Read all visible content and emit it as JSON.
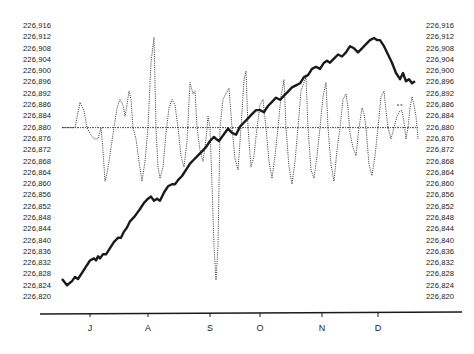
{
  "chart_data": {
    "type": "line",
    "title": "",
    "xlabel": "",
    "ylabel": "",
    "ylim": [
      226820,
      226916
    ],
    "y_ticks": [
      "226,916",
      "226,912",
      "226,908",
      "226,904",
      "226,900",
      "226,896",
      "226,892",
      "226,886",
      "226,884",
      "226,880",
      "226,876",
      "226,872",
      "226,868",
      "226,864",
      "226,860",
      "226,856",
      "226,852",
      "226,848",
      "226,844",
      "226,840",
      "226,836",
      "226,832",
      "226,828",
      "226,824",
      "226,820"
    ],
    "x_ticks": [
      {
        "label": "J",
        "x": 90
      },
      {
        "label": "A",
        "x": 148
      },
      {
        "label": "S",
        "x": 210
      },
      {
        "label": "O",
        "x": 260
      },
      {
        "label": "N",
        "x": 322
      },
      {
        "label": "D",
        "x": 378
      }
    ],
    "reference_line": {
      "value": 226880,
      "style": "dash-dot"
    },
    "series": [
      {
        "name": "trend (solid)",
        "style": "solid",
        "color": "#1a1a1a",
        "points": [
          [
            62,
            226826
          ],
          [
            67,
            226823
          ],
          [
            72,
            226825
          ],
          [
            75,
            226827
          ],
          [
            78,
            226826
          ],
          [
            82,
            226829
          ],
          [
            86,
            226832
          ],
          [
            90,
            226835
          ],
          [
            94,
            226836
          ],
          [
            96,
            226835
          ],
          [
            98,
            226837
          ],
          [
            100,
            226836
          ],
          [
            103,
            226838
          ],
          [
            106,
            226838
          ],
          [
            110,
            226841
          ],
          [
            114,
            226844
          ],
          [
            118,
            226846
          ],
          [
            121,
            226846
          ],
          [
            124,
            226849
          ],
          [
            127,
            226851
          ],
          [
            130,
            226854
          ],
          [
            134,
            226856
          ],
          [
            137,
            226858
          ],
          [
            140,
            226860
          ],
          [
            144,
            226863
          ],
          [
            148,
            226865
          ],
          [
            151,
            226866
          ],
          [
            154,
            226864
          ],
          [
            157,
            226865
          ],
          [
            160,
            226864
          ],
          [
            164,
            226868
          ],
          [
            168,
            226871
          ],
          [
            172,
            226872
          ],
          [
            175,
            226872
          ],
          [
            178,
            226874
          ],
          [
            182,
            226876
          ],
          [
            186,
            226879
          ],
          [
            190,
            226882
          ],
          [
            194,
            226884
          ],
          [
            198,
            226886
          ],
          [
            202,
            226888
          ],
          [
            206,
            226890
          ],
          [
            210,
            226893
          ],
          [
            214,
            226895
          ],
          [
            216,
            226894
          ],
          [
            219,
            226893
          ],
          [
            222,
            226895
          ],
          [
            225,
            226897
          ],
          [
            228,
            226899
          ],
          [
            232,
            226897
          ],
          [
            236,
            226896
          ],
          [
            240,
            226900
          ],
          [
            244,
            226902
          ],
          [
            248,
            226904
          ],
          [
            252,
            226906
          ],
          [
            256,
            226908
          ],
          [
            260,
            226908
          ],
          [
            264,
            226907
          ],
          [
            268,
            226910
          ],
          [
            272,
            226912
          ],
          [
            276,
            226914
          ],
          [
            280,
            226913
          ],
          [
            284,
            226915
          ],
          [
            288,
            226917
          ],
          [
            292,
            226919
          ],
          [
            296,
            226920
          ],
          [
            300,
            226921
          ],
          [
            304,
            226924
          ],
          [
            308,
            226925
          ],
          [
            312,
            226928
          ],
          [
            316,
            226929
          ],
          [
            320,
            226928
          ],
          [
            324,
            226931
          ],
          [
            327,
            226932
          ],
          [
            330,
            226931
          ],
          [
            334,
            226933
          ],
          [
            338,
            226935
          ],
          [
            342,
            226934
          ],
          [
            346,
            226936
          ],
          [
            350,
            226939
          ],
          [
            354,
            226938
          ],
          [
            358,
            226936
          ],
          [
            362,
            226938
          ],
          [
            366,
            226940
          ],
          [
            370,
            226942
          ],
          [
            374,
            226943
          ],
          [
            377,
            226942
          ],
          [
            380,
            226942
          ],
          [
            384,
            226939
          ],
          [
            388,
            226935
          ],
          [
            392,
            226931
          ],
          [
            396,
            226926
          ],
          [
            400,
            226923
          ],
          [
            403,
            226926
          ],
          [
            406,
            226922
          ],
          [
            409,
            226923
          ],
          [
            412,
            226921
          ],
          [
            415,
            226922
          ]
        ]
      },
      {
        "name": "deviation (dotted)",
        "style": "dotted",
        "color": "#333333",
        "points": [
          [
            62,
            226880
          ],
          [
            75,
            226880
          ],
          [
            80,
            226889
          ],
          [
            84,
            226886
          ],
          [
            87,
            226880
          ],
          [
            90,
            226878
          ],
          [
            94,
            226876
          ],
          [
            98,
            226876
          ],
          [
            101,
            226880
          ],
          [
            103,
            226872
          ],
          [
            105,
            226861
          ],
          [
            107,
            226864
          ],
          [
            109,
            226868
          ],
          [
            111,
            226873
          ],
          [
            114,
            226880
          ],
          [
            117,
            226887
          ],
          [
            120,
            226890
          ],
          [
            123,
            226888
          ],
          [
            125,
            226884
          ],
          [
            127,
            226888
          ],
          [
            129,
            226893
          ],
          [
            131,
            226890
          ],
          [
            133,
            226880
          ],
          [
            136,
            226876
          ],
          [
            139,
            226868
          ],
          [
            142,
            226861
          ],
          [
            145,
            226868
          ],
          [
            148,
            226880
          ],
          [
            151,
            226903
          ],
          [
            154,
            226912
          ],
          [
            156,
            226880
          ],
          [
            158,
            226866
          ],
          [
            160,
            226862
          ],
          [
            163,
            226866
          ],
          [
            166,
            226878
          ],
          [
            169,
            226887
          ],
          [
            172,
            226890
          ],
          [
            175,
            226888
          ],
          [
            178,
            226880
          ],
          [
            181,
            226870
          ],
          [
            184,
            226866
          ],
          [
            187,
            226875
          ],
          [
            190,
            226896
          ],
          [
            193,
            226892
          ],
          [
            195,
            226893
          ],
          [
            197,
            226880
          ],
          [
            200,
            226872
          ],
          [
            203,
            226868
          ],
          [
            206,
            226876
          ],
          [
            208,
            226884
          ],
          [
            210,
            226880
          ],
          [
            212,
            226860
          ],
          [
            214,
            226838
          ],
          [
            216,
            226826
          ],
          [
            218,
            226838
          ],
          [
            220,
            226880
          ],
          [
            223,
            226890
          ],
          [
            226,
            226892
          ],
          [
            229,
            226894
          ],
          [
            232,
            226880
          ],
          [
            235,
            226869
          ],
          [
            238,
            226865
          ],
          [
            241,
            226880
          ],
          [
            244,
            226897
          ],
          [
            246,
            226900
          ],
          [
            248,
            226880
          ],
          [
            251,
            226866
          ],
          [
            254,
            226870
          ],
          [
            257,
            226880
          ],
          [
            260,
            226888
          ],
          [
            263,
            226890
          ],
          [
            266,
            226880
          ],
          [
            269,
            226868
          ],
          [
            272,
            226862
          ],
          [
            275,
            226870
          ],
          [
            278,
            226880
          ],
          [
            281,
            226891
          ],
          [
            284,
            226897
          ],
          [
            286,
            226880
          ],
          [
            289,
            226866
          ],
          [
            292,
            226860
          ],
          [
            295,
            226868
          ],
          [
            298,
            226880
          ],
          [
            301,
            226893
          ],
          [
            304,
            226896
          ],
          [
            306,
            226898
          ],
          [
            308,
            226880
          ],
          [
            311,
            226865
          ],
          [
            314,
            226862
          ],
          [
            317,
            226870
          ],
          [
            320,
            226880
          ],
          [
            323,
            226891
          ],
          [
            326,
            226896
          ],
          [
            328,
            226880
          ],
          [
            331,
            226867
          ],
          [
            334,
            226861
          ],
          [
            337,
            226872
          ],
          [
            340,
            226880
          ],
          [
            343,
            226890
          ],
          [
            346,
            226892
          ],
          [
            348,
            226887
          ],
          [
            350,
            226878
          ],
          [
            353,
            226873
          ],
          [
            356,
            226870
          ],
          [
            359,
            226880
          ],
          [
            362,
            226887
          ],
          [
            364,
            226885
          ],
          [
            366,
            226880
          ],
          [
            369,
            226867
          ],
          [
            372,
            226863
          ],
          [
            375,
            226870
          ],
          [
            378,
            226880
          ],
          [
            381,
            226891
          ],
          [
            384,
            226893
          ],
          [
            386,
            226886
          ],
          [
            388,
            226880
          ],
          [
            391,
            226876
          ],
          [
            394,
            226880
          ],
          [
            397,
            226884
          ],
          [
            400,
            226886
          ],
          [
            402,
            226886
          ],
          [
            404,
            226882
          ],
          [
            406,
            226876
          ],
          [
            408,
            226880
          ],
          [
            410,
            226887
          ],
          [
            412,
            226891
          ],
          [
            414,
            226888
          ],
          [
            416,
            226884
          ],
          [
            418,
            226876
          ]
        ]
      }
    ],
    "annotations": [
      {
        "type": "short-dash",
        "x1": 397,
        "x2": 404,
        "value": 226888
      }
    ]
  }
}
